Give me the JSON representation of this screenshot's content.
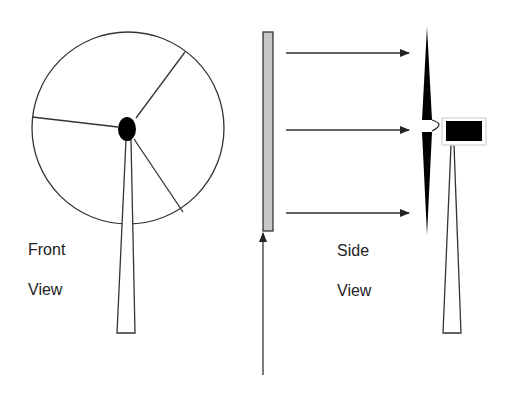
{
  "labels": {
    "front_line1": "Front",
    "front_line2": "View",
    "side_line1": "Side",
    "side_line2": "View"
  },
  "colors": {
    "stroke": "#222222",
    "panel_fill": "#c8c8c8",
    "nacelle_fill": "#000000",
    "nacelle_border": "#e8e8e8"
  },
  "diagram": {
    "front_view": {
      "rotor_circle": {
        "cx": 128,
        "cy": 128,
        "r": 96
      },
      "hub": {
        "cx": 127,
        "cy": 129,
        "rx": 9,
        "ry": 12
      },
      "blade_count": 3
    },
    "wind_panel": {
      "x": 263,
      "y": 32,
      "width": 10,
      "height": 199
    },
    "wind_arrows": [
      {
        "y": 53
      },
      {
        "y": 130
      },
      {
        "y": 213
      }
    ],
    "side_view": {
      "blade": "vertical-tapered",
      "nacelle": "black-box",
      "tower": "tapered"
    }
  }
}
